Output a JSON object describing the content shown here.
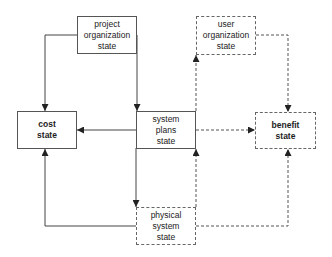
{
  "diagram": {
    "colors": {
      "line": "#444444",
      "background": "#ffffff"
    },
    "nodes": {
      "project_org": {
        "lines": [
          "project",
          "organization",
          "state"
        ],
        "style": "solid"
      },
      "user_org": {
        "lines": [
          "user",
          "organization",
          "state"
        ],
        "style": "dashed"
      },
      "cost": {
        "lines": [
          "cost",
          "state"
        ],
        "style": "solid"
      },
      "system_plans": {
        "lines": [
          "system",
          "plans",
          "state"
        ],
        "style": "solid"
      },
      "benefit": {
        "lines": [
          "benefit",
          "state"
        ],
        "style": "dashed"
      },
      "physical_system": {
        "lines": [
          "physical",
          "system",
          "state"
        ],
        "style": "dashed"
      }
    },
    "edges": [
      {
        "from": "project organization state",
        "to": "cost state",
        "style": "solid"
      },
      {
        "from": "project organization state",
        "to": "system plans state",
        "style": "solid"
      },
      {
        "from": "system plans state",
        "to": "cost state",
        "style": "solid"
      },
      {
        "from": "system plans state",
        "to": "physical system state",
        "style": "solid"
      },
      {
        "from": "physical system state",
        "to": "cost state",
        "style": "solid"
      },
      {
        "from": "system plans state",
        "to": "user organization state",
        "style": "dashed"
      },
      {
        "from": "user organization state",
        "to": "benefit state",
        "style": "dashed"
      },
      {
        "from": "system plans state",
        "to": "benefit state",
        "style": "dashed"
      },
      {
        "from": "physical system state",
        "to": "system plans state",
        "style": "dashed"
      },
      {
        "from": "physical system state",
        "to": "benefit state",
        "style": "dashed"
      }
    ]
  }
}
